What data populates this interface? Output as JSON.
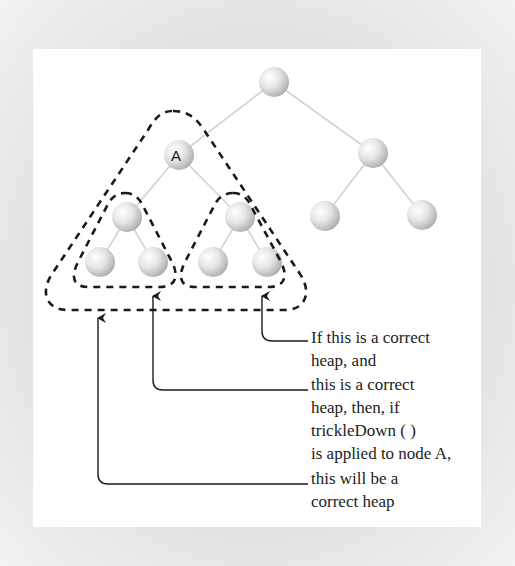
{
  "diagram": {
    "node_label": "A",
    "colors": {
      "panel_background": "#ffffff",
      "frame_background": "#e2e2e2",
      "edge": "#cfcfcf",
      "dashed_outline": "#1a1a1a",
      "arrow": "#1a1a1a",
      "text": "#222222"
    },
    "nodes": [
      {
        "id": "root",
        "x": 274,
        "y": 82,
        "label": ""
      },
      {
        "id": "A",
        "x": 179,
        "y": 155,
        "label": "A"
      },
      {
        "id": "R",
        "x": 373,
        "y": 153,
        "label": ""
      },
      {
        "id": "AL",
        "x": 127,
        "y": 217,
        "label": ""
      },
      {
        "id": "AR",
        "x": 240,
        "y": 217,
        "label": ""
      },
      {
        "id": "RL",
        "x": 325,
        "y": 216,
        "label": ""
      },
      {
        "id": "RR",
        "x": 422,
        "y": 215,
        "label": ""
      },
      {
        "id": "ALL",
        "x": 100,
        "y": 262,
        "label": ""
      },
      {
        "id": "ALR",
        "x": 153,
        "y": 262,
        "label": ""
      },
      {
        "id": "ARL",
        "x": 213,
        "y": 262,
        "label": ""
      },
      {
        "id": "ARR",
        "x": 267,
        "y": 262,
        "label": ""
      }
    ],
    "annotations": [
      {
        "id": "right-subtree",
        "lines": [
          "If this is a correct",
          "heap, and"
        ]
      },
      {
        "id": "left-subtree",
        "lines": [
          "this is a correct",
          "heap, then, if",
          "trickleDown ( )",
          "is applied to node A,"
        ]
      },
      {
        "id": "whole-subtree",
        "lines": [
          "this will be a",
          "correct heap"
        ]
      }
    ]
  }
}
